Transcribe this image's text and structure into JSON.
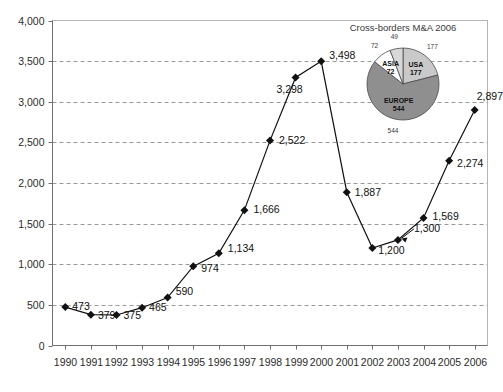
{
  "chart_data": {
    "type": "line",
    "title": "",
    "xlabel": "",
    "ylabel": "",
    "ylim": [
      0,
      4000
    ],
    "ytick_step": 500,
    "grid": true,
    "legend": "none",
    "categories": [
      "1990",
      "1991",
      "1992",
      "1993",
      "1994",
      "1995",
      "1996",
      "1997",
      "1998",
      "1999",
      "2000",
      "2001",
      "2002",
      "2003",
      "2004",
      "2005",
      "2006"
    ],
    "values": [
      473,
      379,
      375,
      465,
      590,
      974,
      1134,
      1666,
      2522,
      3298,
      3498,
      1887,
      1200,
      1300,
      1569,
      2274,
      2897
    ],
    "point_labels": [
      "473",
      "379",
      "375",
      "465",
      "590",
      "974",
      "1,134",
      "1,666",
      "2,522",
      "3,298",
      "3,498",
      "1,887",
      "1,200",
      "1,300",
      "1,569",
      "2,274",
      "2,897"
    ],
    "ytick_labels": [
      "0",
      "500",
      "1,000",
      "1,500",
      "2,000",
      "2,500",
      "3,000",
      "3,500",
      "4,000"
    ],
    "marker": "diamond",
    "marker_color": "#111111",
    "line_color": "#111111"
  },
  "inset_pie": {
    "type": "pie",
    "title": "Cross-borders M&A 2006",
    "labels": [
      "USA",
      "EUROPE",
      "ASIA",
      ""
    ],
    "inner_labels": [
      "USA",
      "EUROPE",
      "ASIA",
      ""
    ],
    "inner_values": [
      "177",
      "544",
      "72",
      ""
    ],
    "outer_values": [
      "177",
      "544",
      "72",
      "49"
    ],
    "values": [
      177,
      544,
      72,
      49
    ],
    "colors": [
      "#c9c9c9",
      "#8f8f8f",
      "#ffffff",
      "#d8d8d8"
    ]
  },
  "axis": {
    "y_min_label": "0",
    "y_max_label": "4,000"
  }
}
